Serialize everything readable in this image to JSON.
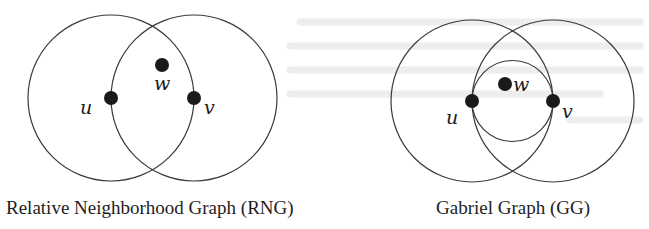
{
  "figures": [
    {
      "id": "rng",
      "caption": "Relative Neighborhood Graph (RNG)",
      "nodes": [
        {
          "label": "u",
          "x": 111,
          "y": 98
        },
        {
          "label": "v",
          "x": 194,
          "y": 98
        },
        {
          "label": "w",
          "x": 162,
          "y": 65
        }
      ],
      "circles": [
        {
          "name": "circle-centered-u",
          "cx": 111,
          "cy": 98,
          "r": 83
        },
        {
          "name": "circle-centered-v",
          "cx": 194,
          "cy": 98,
          "r": 83
        }
      ]
    },
    {
      "id": "gg",
      "caption": "Gabriel Graph (GG)",
      "nodes": [
        {
          "label": "u",
          "x": 472,
          "y": 101
        },
        {
          "label": "v",
          "x": 553,
          "y": 101
        },
        {
          "label": "w",
          "x": 505,
          "y": 84
        }
      ],
      "circles": [
        {
          "name": "circle-centered-u",
          "cx": 472,
          "cy": 101,
          "r": 81
        },
        {
          "name": "circle-centered-v",
          "cx": 553,
          "cy": 101,
          "r": 81
        },
        {
          "name": "diametral-circle-uv",
          "cx": 512,
          "cy": 101,
          "r": 40.5
        }
      ]
    }
  ],
  "colors": {
    "stroke": "#3a3a3a",
    "node": "#1a1a1a",
    "background": "#ffffff"
  }
}
